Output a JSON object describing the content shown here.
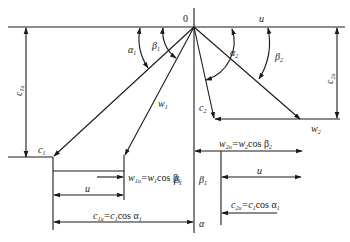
{
  "diagram": {
    "type": "velocity-triangles",
    "origin_label": "0",
    "labels": {
      "u_top": "u",
      "alpha1": "α",
      "alpha1_sub": "1",
      "beta1": "β",
      "beta1_sub": "1",
      "alpha2": "α",
      "alpha2_sub": "2",
      "beta2": "β",
      "beta2_sub": "2",
      "c1a": "c",
      "c1a_sub": "1a",
      "c2a": "c",
      "c2a_sub": "2a",
      "w1": "w",
      "w1_sub": "1",
      "c1": "c",
      "c1_sub": "1",
      "c2": "c",
      "c2_sub": "2",
      "w2": "w",
      "w2_sub": "2",
      "w1u_eq": "w",
      "w1u_sub": "1u",
      "w1u_rhs": "=w",
      "w1u_rhs_sub": "1",
      "w1u_cos": "cos β",
      "w1u_cos_sub": "1",
      "u_mid_left": "u",
      "c1u_eq": "c",
      "c1u_sub": "1u",
      "c1u_rhs": "=c",
      "c1u_rhs_sub": "1",
      "c1u_cos": "cos α",
      "c1u_cos_sub": "1",
      "w2u_eq": "w",
      "w2u_sub": "2u",
      "w2u_rhs": "=w",
      "w2u_rhs_sub": "2",
      "w2u_cos": "cos β",
      "w2u_cos_sub": "2",
      "beta1_mid_left": "β",
      "beta1_mid_left_sub": "1",
      "beta1_mid_right": "β",
      "beta1_mid_right_sub": "1",
      "u_mid_right": "u",
      "c2u_eq": "c",
      "c2u_sub": "2u",
      "c2u_rhs": "=c",
      "c2u_rhs_sub": "1",
      "c2u_cos": "cos α",
      "c2u_cos_sub": "1",
      "alpha_bottom": "α"
    }
  }
}
